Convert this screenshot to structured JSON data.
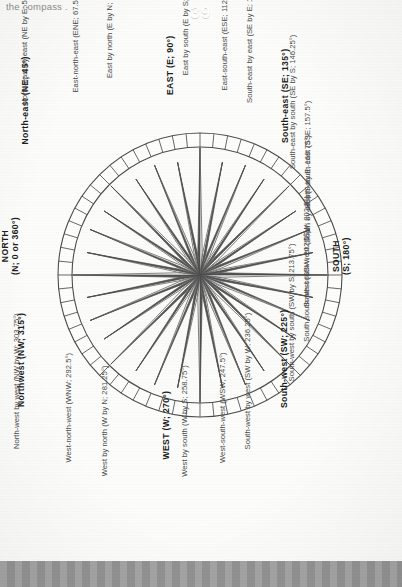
{
  "header": {
    "running_text": "the compass ."
  },
  "footer": {
    "page_number": "39"
  },
  "colors": {
    "ray_dark": "#575757",
    "ray_light": "#fbfbf9",
    "outline": "#4c4c4c",
    "footer_bar": "#9a9a9a",
    "page_background": "#fcfcfa",
    "label_text": "#4a4a4a",
    "principal_text": "#1c1c1c"
  },
  "compass": {
    "center_x": 200,
    "center_y": 275,
    "outer_radius": 142,
    "inner_ring_radius": 128,
    "point_count": 32,
    "points": [
      {
        "label": "NORTH\n(N; 0 or 360°)",
        "name": "north",
        "abbr": "N",
        "degrees": 0,
        "principal": true
      },
      {
        "label": "North by east (N by E; 11.25°)",
        "name": "north-by-east",
        "abbr": "N by E",
        "degrees": 11.25,
        "principal": false
      },
      {
        "label": "North-north-east (NNE; 22.5°)",
        "name": "north-north-east",
        "abbr": "NNE",
        "degrees": 22.5,
        "principal": false
      },
      {
        "label": "North-east by north (NE by N; 33.75°)",
        "name": "north-east-by-north",
        "abbr": "NE by N",
        "degrees": 33.75,
        "principal": false
      },
      {
        "label": "North-east (NE; 45°)",
        "name": "north-east",
        "abbr": "NE",
        "degrees": 45,
        "principal": true
      },
      {
        "label": "North-east by east (NE by E; 56.25°)",
        "name": "north-east-by-east",
        "abbr": "NE by E",
        "degrees": 56.25,
        "principal": false
      },
      {
        "label": "East-north-east (ENE; 67.5°)",
        "name": "east-north-east",
        "abbr": "ENE",
        "degrees": 67.5,
        "principal": false
      },
      {
        "label": "East by north (E by N; 78.75°)",
        "name": "east-by-north",
        "abbr": "E by N",
        "degrees": 78.75,
        "principal": false
      },
      {
        "label": "EAST (E; 90°)",
        "name": "east",
        "abbr": "E",
        "degrees": 90,
        "principal": true
      },
      {
        "label": "East by south (E by S; 101.25°)",
        "name": "east-by-south",
        "abbr": "E by S",
        "degrees": 101.25,
        "principal": false
      },
      {
        "label": "East-south-east (ESE; 112.5°)",
        "name": "east-south-east",
        "abbr": "ESE",
        "degrees": 112.5,
        "principal": false
      },
      {
        "label": "South-east by east (SE by E; 123.75°)",
        "name": "south-east-by-east",
        "abbr": "SE by E",
        "degrees": 123.75,
        "principal": false
      },
      {
        "label": "South-east (SE; 135°)",
        "name": "south-east",
        "abbr": "SE",
        "degrees": 135,
        "principal": true
      },
      {
        "label": "South-east by south (SE by S; 146.25°)",
        "name": "south-east-by-south",
        "abbr": "SE by S",
        "degrees": 146.25,
        "principal": false
      },
      {
        "label": "South-south-east (SSE; 157.5°)",
        "name": "south-south-east",
        "abbr": "SSE",
        "degrees": 157.5,
        "principal": false
      },
      {
        "label": "South by east (S by E; 168.75°)",
        "name": "south-by-east",
        "abbr": "S by E",
        "degrees": 168.75,
        "principal": false
      },
      {
        "label": "SOUTH\n(S; 180°)",
        "name": "south",
        "abbr": "S",
        "degrees": 180,
        "principal": true
      },
      {
        "label": "South-south-west (SSW; 202.5°)",
        "name": "south-south-west-upper",
        "abbr": "SSW",
        "degrees": 191.25,
        "principal": false
      },
      {
        "label": "South-south-west (SSW; 202.5°)",
        "name": "south-south-west",
        "abbr": "SSW",
        "degrees": 202.5,
        "principal": false
      },
      {
        "label": "South-west by south (SW by S; 213.75°)",
        "name": "south-west-by-south",
        "abbr": "SW by S",
        "degrees": 213.75,
        "principal": false
      },
      {
        "label": "South-west (SW; 225°)",
        "name": "south-west",
        "abbr": "SW",
        "degrees": 225,
        "principal": true
      },
      {
        "label": "South-west by west (SW by W; 236.25°)",
        "name": "south-west-by-west",
        "abbr": "SW by W",
        "degrees": 236.25,
        "principal": false
      },
      {
        "label": "West-south-west (WSW; 247.5°)",
        "name": "west-south-west",
        "abbr": "WSW",
        "degrees": 247.5,
        "principal": false
      },
      {
        "label": "West by south (W by S; 258.75°)",
        "name": "west-by-south",
        "abbr": "W by S",
        "degrees": 258.75,
        "principal": false
      },
      {
        "label": "WEST (W; 270°)",
        "name": "west",
        "abbr": "W",
        "degrees": 270,
        "principal": true
      },
      {
        "label": "West by north (W by N; 281.25°)",
        "name": "west-by-north",
        "abbr": "W by N",
        "degrees": 281.25,
        "principal": false
      },
      {
        "label": "West-north-west (WNW; 292.5°)",
        "name": "west-north-west",
        "abbr": "WNW",
        "degrees": 292.5,
        "principal": false
      },
      {
        "label": "North-west by west (NW by W; 303.75°)",
        "name": "north-west-by-west",
        "abbr": "NW by W",
        "degrees": 303.75,
        "principal": false
      },
      {
        "label": "Northwest (NW; 315°)",
        "name": "north-west",
        "abbr": "NW",
        "degrees": 315,
        "principal": true
      },
      {
        "label": "North-west by north (NW by N;326.25°)",
        "name": "north-west-by-north",
        "abbr": "NW by N",
        "degrees": 326.25,
        "principal": false
      },
      {
        "label": "North-north-west (NNW; 337.5°)",
        "name": "north-north-west",
        "abbr": "NNW",
        "degrees": 337.5,
        "principal": false
      },
      {
        "label": "North by west (N by W; 348.75°)",
        "name": "north-by-west",
        "abbr": "N by W",
        "degrees": 348.75,
        "principal": false
      }
    ]
  }
}
